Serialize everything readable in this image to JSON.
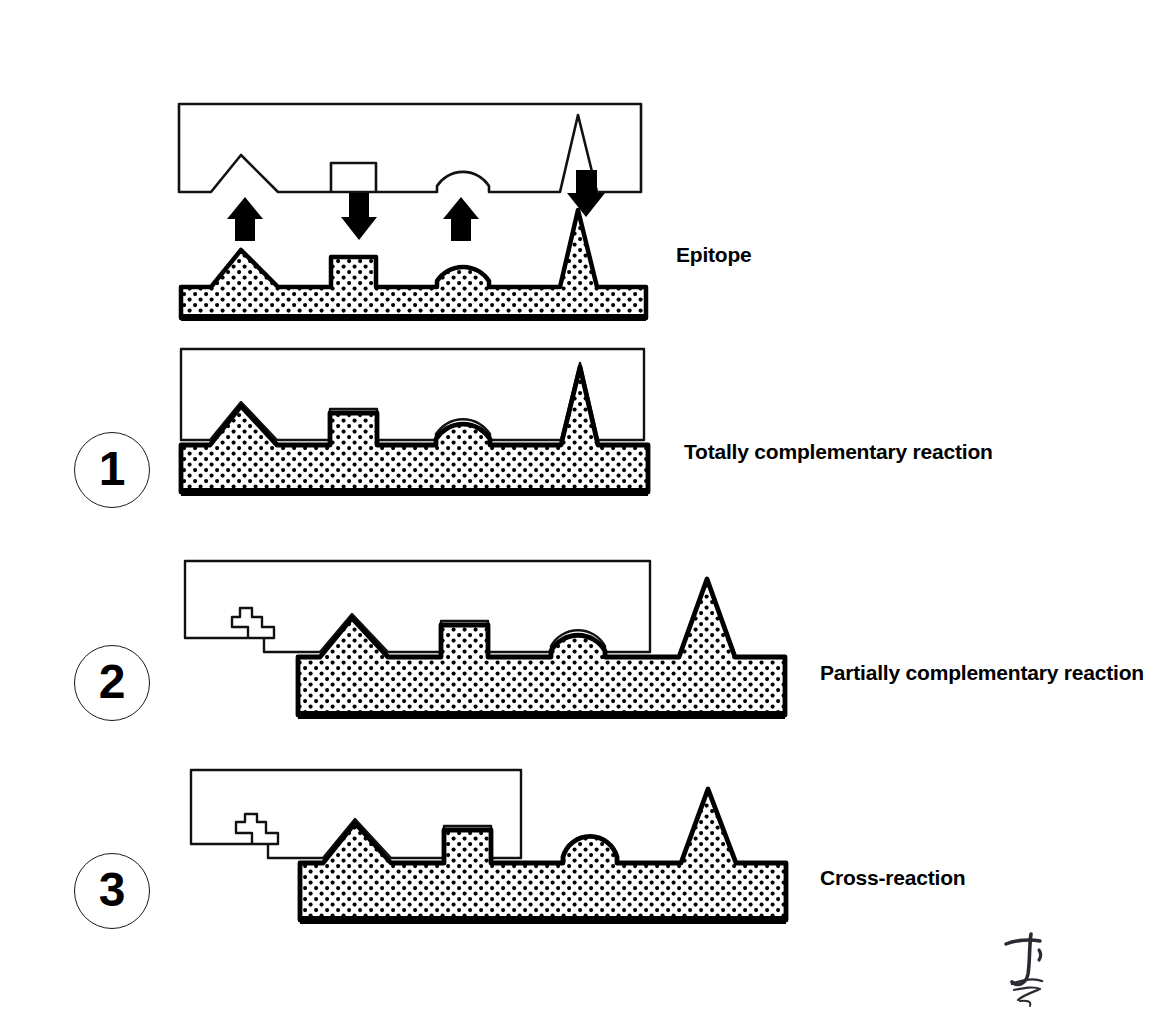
{
  "figure": {
    "background_color": "#ffffff",
    "ink_color": "#000000",
    "fill_pattern": "dotted-stipple"
  },
  "captions": {
    "epitope": "Epitope",
    "totally_complementary": "Totally complementary reaction",
    "partially_complementary": "Partially complementary reaction",
    "cross_reaction": "Cross-reaction"
  },
  "steps": [
    {
      "number": "1",
      "caption_key": "totally_complementary"
    },
    {
      "number": "2",
      "caption_key": "partially_complementary"
    },
    {
      "number": "3",
      "caption_key": "cross_reaction"
    }
  ],
  "arrows": [
    {
      "name": "arrow-up-triangle",
      "direction": "up",
      "x": 245,
      "points_to": "triangle-epitope"
    },
    {
      "name": "arrow-down-rectangle",
      "direction": "down",
      "x": 359,
      "points_to": "rectangle-epitope"
    },
    {
      "name": "arrow-up-dome",
      "direction": "up",
      "x": 461,
      "points_to": "dome-epitope"
    },
    {
      "name": "arrow-down-spike",
      "direction": "down",
      "x": 586,
      "points_to": "spike-epitope"
    }
  ],
  "epitope_shapes": [
    {
      "name": "triangle-epitope",
      "shape": "triangle"
    },
    {
      "name": "rectangle-epitope",
      "shape": "rectangle"
    },
    {
      "name": "dome-epitope",
      "shape": "semicircle"
    },
    {
      "name": "spike-epitope",
      "shape": "tall-narrow-triangle"
    },
    {
      "name": "step-epitope",
      "shape": "staircase"
    }
  ],
  "panels": [
    {
      "name": "panel-epitope",
      "antibody_label": "antibody-unbound",
      "antigen_label": "antigen-unbound",
      "binding": "none",
      "matched_epitopes": []
    },
    {
      "name": "panel-totally-complementary",
      "binding": "total",
      "matched_epitopes": [
        "triangle-epitope",
        "rectangle-epitope",
        "dome-epitope",
        "spike-epitope"
      ],
      "unmatched_epitopes": []
    },
    {
      "name": "panel-partially-complementary",
      "binding": "partial",
      "matched_epitopes": [
        "triangle-epitope",
        "rectangle-epitope",
        "dome-epitope"
      ],
      "unmatched_epitopes": [
        "spike-epitope",
        "step-epitope"
      ]
    },
    {
      "name": "panel-cross-reaction",
      "binding": "cross",
      "matched_epitopes": [
        "triangle-epitope",
        "rectangle-epitope"
      ],
      "unmatched_epitopes": [
        "dome-epitope",
        "spike-epitope",
        "step-epitope"
      ]
    }
  ],
  "signature": {
    "name": "artist-signature",
    "present": true
  }
}
